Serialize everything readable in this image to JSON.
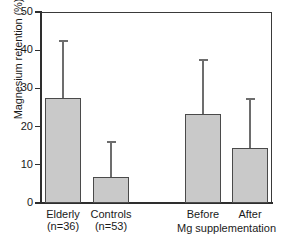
{
  "chart_data": {
    "type": "bar",
    "title": "",
    "xlabel": "",
    "ylabel": "Magnesium retention (%)",
    "ylim": [
      0,
      50
    ],
    "yticks": [
      0,
      10,
      20,
      30,
      40,
      50
    ],
    "ytick_labels": [
      "0",
      "10",
      "20",
      "30",
      "40",
      "50"
    ],
    "grid": false,
    "legend": null,
    "categories": [
      "Elderly",
      "Controls",
      "Before",
      "After"
    ],
    "category_sublabels": [
      "(n=36)",
      "(n=53)",
      "",
      ""
    ],
    "values": [
      27.5,
      6.8,
      23.4,
      14.4
    ],
    "error_upper": [
      14.9,
      9.2,
      14.0,
      12.8
    ],
    "error_cap_values": [
      42.4,
      16.0,
      37.4,
      27.2
    ],
    "error_direction": "upper-only",
    "group_annotation": "Mg supplementation",
    "group_annotation_covers": [
      "Before",
      "After"
    ],
    "bar_fill_color": "#c9c9c9",
    "bar_edge_color": "#4a4a4a",
    "error_color": "#6d6d6d",
    "axis_color": "#2e2e2e",
    "background_color": "#ffffff"
  }
}
